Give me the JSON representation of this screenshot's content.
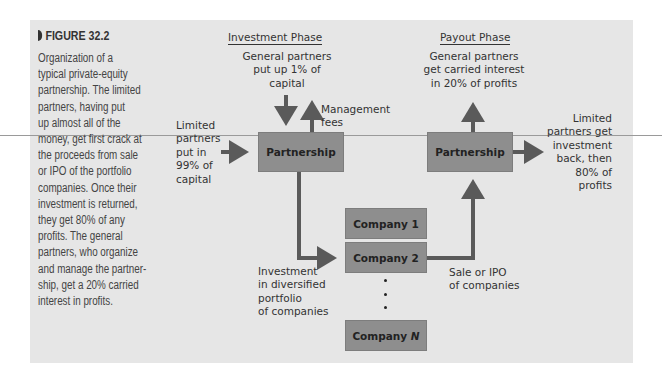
{
  "figure": {
    "label": "FIGURE 32.2",
    "caption_lines": [
      "Organization of a",
      "typical private-equity",
      "partnership. The limited",
      "partners, having put",
      "up almost all of the",
      "money, get first crack at",
      "the proceeds from sale",
      "or IPO of the portfolio",
      "companies. Once their",
      "investment is returned,",
      "they get 80% of any",
      "profits. The general",
      "partners, who organize",
      "and manage the partner-",
      "ship, get a 20% carried",
      "interest in profits."
    ]
  },
  "diagram": {
    "investment_phase": {
      "title": "Investment Phase",
      "general_partners_lines": [
        "General partners",
        "put up 1% of",
        "capital"
      ],
      "management_fees_lines": [
        "Management",
        "fees"
      ],
      "limited_partners_lines": [
        "Limited",
        "partners",
        "put in",
        "99% of",
        "capital"
      ],
      "partnership_label": "Partnership",
      "investment_lines": [
        "Investment",
        "in diversified",
        "portfolio",
        "of companies"
      ]
    },
    "payout_phase": {
      "title": "Payout Phase",
      "general_partners_lines": [
        "General partners",
        "get carried interest",
        "in 20% of profits"
      ],
      "limited_partners_lines": [
        "Limited",
        "partners get",
        "investment",
        "back, then",
        "80% of",
        "profits"
      ],
      "partnership_label": "Partnership",
      "sale_lines": [
        "Sale or IPO",
        "of companies"
      ]
    },
    "companies": {
      "company_1": "Company 1",
      "company_2": "Company 2",
      "company_n_prefix": "Company ",
      "company_n_suffix": "N"
    }
  },
  "colors": {
    "panel_bg": "#e6e6e6",
    "box_fill": "#8e8e8e",
    "arrow": "#5a5a5a",
    "text": "#333333"
  }
}
